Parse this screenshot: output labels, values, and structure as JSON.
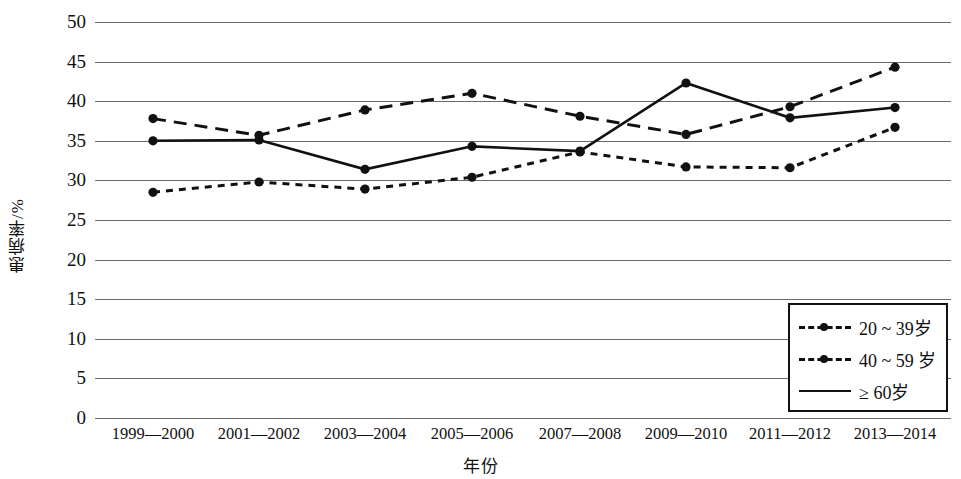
{
  "chart_data": {
    "type": "line",
    "title": "",
    "xlabel": "年份",
    "ylabel": "患病率/%",
    "categories": [
      "1999—2000",
      "2001—2002",
      "2003—2004",
      "2005—2006",
      "2007—2008",
      "2009—2010",
      "2011—2012",
      "2013—2014"
    ],
    "yticks": [
      0,
      5,
      10,
      15,
      20,
      25,
      30,
      35,
      40,
      45,
      50
    ],
    "ylim": [
      0,
      50
    ],
    "grid": "horizontal",
    "legend_position": "bottom-right",
    "series": [
      {
        "name": "20 ~ 39岁",
        "style": "dotted",
        "marker": "circle",
        "color": "#111111",
        "values": [
          28.5,
          29.8,
          28.9,
          30.4,
          33.6,
          31.7,
          31.6,
          36.7
        ]
      },
      {
        "name": "40 ~ 59 岁",
        "style": "dashed",
        "marker": "circle",
        "color": "#111111",
        "values": [
          37.8,
          35.7,
          38.9,
          41.0,
          38.1,
          35.8,
          39.3,
          44.3
        ]
      },
      {
        "name": "≥ 60岁",
        "style": "solid",
        "marker": "circle",
        "color": "#111111",
        "values": [
          35.0,
          35.1,
          31.4,
          34.3,
          33.7,
          42.3,
          37.9,
          39.2
        ]
      }
    ]
  },
  "axis": {
    "y_title": "患病率/%",
    "x_title": "年份"
  }
}
